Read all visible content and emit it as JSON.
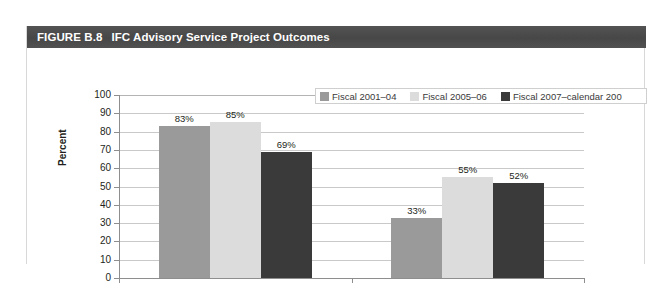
{
  "figure": {
    "number": "FIGURE B.8",
    "title": "IFC Advisory Service Project Outcomes"
  },
  "colors": {
    "title_bar": "#4b4b4b",
    "series1": "#9a9a9a",
    "series2": "#dcdcdc",
    "series3": "#3a3a3a",
    "gridline": "#c9c9c9",
    "axis": "#8e8e8e",
    "text": "#231f20"
  },
  "chart_data": {
    "type": "bar",
    "title": "IFC Advisory Service Project Outcomes",
    "xlabel": "",
    "ylabel": "Percent",
    "ylim": [
      0,
      100
    ],
    "yticks": [
      0,
      10,
      20,
      30,
      40,
      50,
      60,
      70,
      80,
      90,
      100
    ],
    "ytick_labels": [
      "0",
      "10",
      "20",
      "30",
      "40",
      "50",
      "60",
      "70",
      "80",
      "90",
      "100"
    ],
    "grid": true,
    "legend_position": "top-right",
    "categories": [
      "",
      ""
    ],
    "series": [
      {
        "name": "Fiscal 2001–04",
        "color": "#9a9a9a",
        "values": [
          83,
          33
        ],
        "labels": [
          "83%",
          "33%"
        ]
      },
      {
        "name": "Fiscal 2005–06",
        "color": "#dcdcdc",
        "values": [
          85,
          55
        ],
        "labels": [
          "85%",
          "55%"
        ]
      },
      {
        "name": "Fiscal 2007–calendar 200",
        "color": "#3a3a3a",
        "values": [
          69,
          52
        ],
        "labels": [
          "69%",
          "52%"
        ]
      }
    ]
  }
}
